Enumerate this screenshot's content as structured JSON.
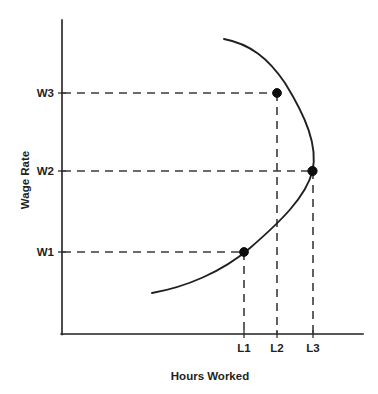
{
  "chart_data": {
    "type": "line",
    "title": "",
    "xlabel": "Hours Worked",
    "ylabel": "Wage Rate",
    "grid": false,
    "legend": false,
    "x_tick_labels": [
      "L1",
      "L2",
      "L3"
    ],
    "y_tick_labels": [
      "W1",
      "W2",
      "W3"
    ],
    "x_ticks": [
      {
        "label": "L1",
        "px": 244
      },
      {
        "label": "L2",
        "px": 277
      },
      {
        "label": "L3",
        "px": 313
      }
    ],
    "y_ticks": [
      {
        "label": "W1",
        "px": 252
      },
      {
        "label": "W2",
        "px": 171
      },
      {
        "label": "W3",
        "px": 93
      }
    ],
    "series": [
      {
        "name": "Labor supply curve",
        "points": [
          {
            "x_label": "L1",
            "y_label": "W1",
            "px": 244,
            "py": 252
          },
          {
            "x_label": "L3",
            "y_label": "W2",
            "px": 313,
            "py": 171
          },
          {
            "x_label": "L2",
            "y_label": "W3",
            "px": 277,
            "py": 93
          }
        ],
        "path": "M 152 293 C 186 287, 222 272, 250 248 C 280 222, 306 197, 312.5 171 C 318 146, 306 117, 285 83 C 268 58, 250 44, 224 39"
      }
    ],
    "annotations": {
      "marked_points": [
        {
          "label": "(L1, W1)",
          "x_label": "L1",
          "y_label": "W1"
        },
        {
          "label": "(L3, W2)",
          "x_label": "L3",
          "y_label": "W2"
        },
        {
          "label": "(L2, W3)",
          "x_label": "L2",
          "y_label": "W3"
        }
      ]
    },
    "axes_geometry": {
      "origin_x": 62,
      "origin_y": 334,
      "y_axis_top": 20,
      "x_axis_right": 363
    },
    "colors": {
      "axis": "#231f20",
      "curve": "#231f20",
      "guide": "#3a3a3a",
      "point": "#0d0d0d",
      "background": "#ffffff"
    }
  },
  "labels": {
    "y_axis_title": "Wage Rate",
    "x_axis_title": "Hours Worked",
    "w1": "W1",
    "w2": "W2",
    "w3": "W3",
    "l1": "L1",
    "l2": "L2",
    "l3": "L3"
  }
}
